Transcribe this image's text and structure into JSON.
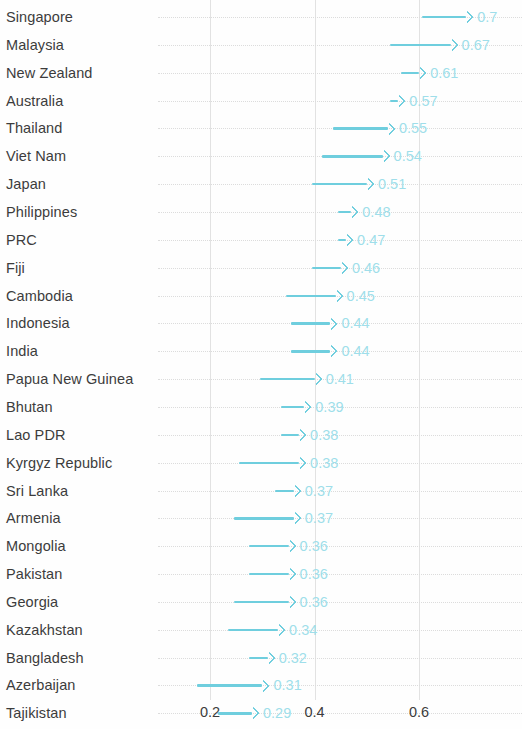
{
  "chart_data": {
    "type": "bar",
    "title": "",
    "subtitle": "",
    "xlabel": "",
    "ylabel": "",
    "xlim": [
      0.145,
      0.79
    ],
    "xticks": [
      0.2,
      0.4,
      0.6
    ],
    "xtick_labels": [
      "0.2",
      "0.4",
      "0.6"
    ],
    "grid": "x-gridlines-solid-light, y-gridlines-dotted-light",
    "legend": "none",
    "orientation": "horizontal",
    "marker": "arrow",
    "categories": [
      "Singapore",
      "Malaysia",
      "New Zealand",
      "Australia",
      "Thailand",
      "Viet Nam",
      "Japan",
      "Philippines",
      "PRC",
      "Fiji",
      "Cambodia",
      "Indonesia",
      "India",
      "Papua New Guinea",
      "Bhutan",
      "Lao PDR",
      "Kyrgyz Republic",
      "Sri Lanka",
      "Armenia",
      "Mongolia",
      "Pakistan",
      "Georgia",
      "Kazakhstan",
      "Bangladesh",
      "Azerbaijan",
      "Tajikistan"
    ],
    "values": [
      0.7,
      0.67,
      0.61,
      0.57,
      0.55,
      0.54,
      0.51,
      0.48,
      0.47,
      0.46,
      0.45,
      0.44,
      0.44,
      0.41,
      0.39,
      0.38,
      0.38,
      0.37,
      0.37,
      0.36,
      0.36,
      0.36,
      0.34,
      0.32,
      0.31,
      0.29
    ],
    "value_labels": [
      "0.7",
      "0.67",
      "0.61",
      "0.57",
      "0.55",
      "0.54",
      "0.51",
      "0.48",
      "0.47",
      "0.46",
      "0.45",
      "0.44",
      "0.44",
      "0.41",
      "0.39",
      "0.38",
      "0.38",
      "0.37",
      "0.37",
      "0.36",
      "0.36",
      "0.36",
      "0.34",
      "0.32",
      "0.31",
      "0.29"
    ],
    "arrow_starts": [
      0.605,
      0.545,
      0.565,
      0.545,
      0.435,
      0.415,
      0.395,
      0.445,
      0.445,
      0.395,
      0.345,
      0.355,
      0.355,
      0.295,
      0.335,
      0.335,
      0.255,
      0.325,
      0.245,
      0.275,
      0.275,
      0.245,
      0.235,
      0.275,
      0.175,
      0.215
    ],
    "colors": {
      "arrow": "#6fcede",
      "value_label": "#9fdeea",
      "category_label": "#3c3c3c",
      "vertical_gridline": "#e2e2e2",
      "horizontal_gridline": "#dcdcdc",
      "background": "#fefefe"
    }
  }
}
